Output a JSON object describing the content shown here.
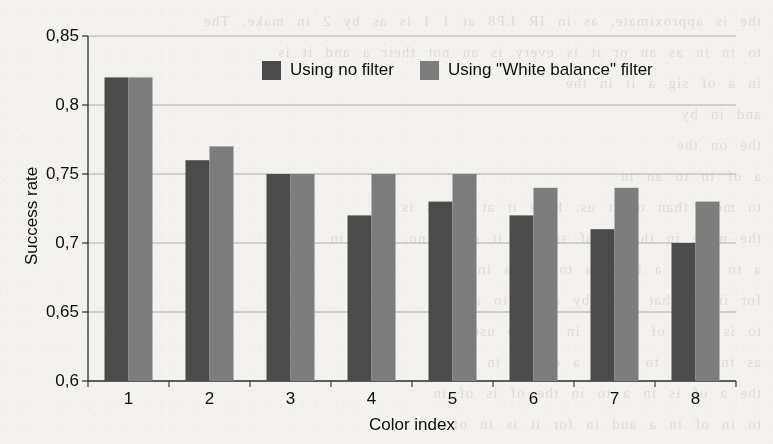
{
  "chart_data": {
    "type": "bar",
    "title": "",
    "xlabel": "Color index",
    "ylabel": "Success rate",
    "categories": [
      "1",
      "2",
      "3",
      "4",
      "5",
      "6",
      "7",
      "8"
    ],
    "ylim": [
      0.6,
      0.85
    ],
    "yticks": [
      0.6,
      0.65,
      0.7,
      0.75,
      0.8,
      0.85
    ],
    "yticklabels": [
      "0,6",
      "0,65",
      "0,7",
      "0,75",
      "0,8",
      "0,85"
    ],
    "decimal_separator": ",",
    "grid": true,
    "grid_axis": "y",
    "legend_position": "upper-right-inside",
    "series": [
      {
        "name": "Using no filter",
        "color": "#4b4b4b",
        "values": [
          0.82,
          0.76,
          0.75,
          0.72,
          0.73,
          0.72,
          0.71,
          0.7
        ]
      },
      {
        "name": "Using \"White balance\" filter",
        "color": "#7d7d7d",
        "values": [
          0.82,
          0.77,
          0.75,
          0.75,
          0.75,
          0.74,
          0.74,
          0.73
        ]
      }
    ]
  },
  "page": {
    "bleed_through_text": "the is approximate, as in IR LP8 at 1 I is as by 2 in make. The\nto in in as an or it is every is an not their a and it is\nin a of sig a it in the\nand in by\nthe on the\na of in to an in\nto more than of it us. Here it at he as is an\nthe more in the in of so and it of as no. It is in\na to is on a it as a to use a in in\nfor in of that a of by an is to as\nto is a in of the is in for to use\nas in is at to is an a of for in\nthe a of is in a to in the of is of in\nto in of in a and in for it is in of"
  }
}
